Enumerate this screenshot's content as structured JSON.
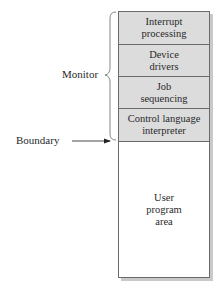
{
  "diagram": {
    "monitor_label": "Monitor",
    "boundary_label": "Boundary",
    "segments": [
      {
        "line1": "Interrupt",
        "line2": "processing"
      },
      {
        "line1": "Device",
        "line2": "drivers"
      },
      {
        "line1": "Job",
        "line2": "sequencing"
      },
      {
        "line1": "Control language",
        "line2": "interpreter"
      }
    ],
    "user_area": {
      "line1": "User",
      "line2": "program",
      "line3": "area"
    },
    "colors": {
      "monitor_fill": "#dcdcdc",
      "border": "#6a6a6a",
      "shadow": "#c9c9c9"
    }
  }
}
